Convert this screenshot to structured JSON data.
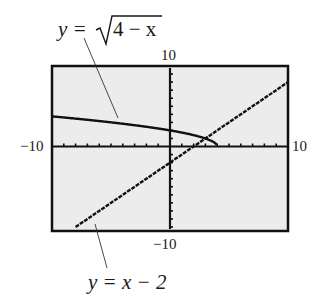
{
  "chart_data": {
    "type": "line",
    "title": "",
    "xlabel": "",
    "ylabel": "",
    "xlim": [
      -10,
      10
    ],
    "ylim": [
      -10,
      10
    ],
    "grid": false,
    "tick_labels": {
      "xmin": "−10",
      "xmax": "10",
      "ymin": "−10",
      "ymax": "10"
    },
    "series": [
      {
        "name": "y = √(4 − x)",
        "x": [
          -10,
          -8,
          -6,
          -4,
          -2,
          0,
          2,
          4
        ],
        "y": [
          3.74,
          3.46,
          3.16,
          2.83,
          2.45,
          2.0,
          1.41,
          0
        ]
      },
      {
        "name": "y = x − 2",
        "x": [
          -8,
          -6,
          -4,
          -2,
          0,
          2,
          4,
          6,
          8,
          10
        ],
        "y": [
          -10,
          -8,
          -6,
          -4,
          -2,
          0,
          2,
          4,
          6,
          8
        ]
      }
    ],
    "annotations": [
      {
        "text": "y = √(4 − x)",
        "target_series": 0
      },
      {
        "text": "y = x − 2",
        "target_series": 1
      }
    ]
  },
  "labels": {
    "sqrt_eq_prefix": "y = ",
    "sqrt_eq_radicand": "4 − x",
    "line_eq": "y = x − 2",
    "ymax": "10",
    "ymin": "−10",
    "xmin": "−10",
    "xmax": "10"
  },
  "colors": {
    "screen_bg": "#ececec",
    "frame": "#111111",
    "curve": "#111111"
  }
}
